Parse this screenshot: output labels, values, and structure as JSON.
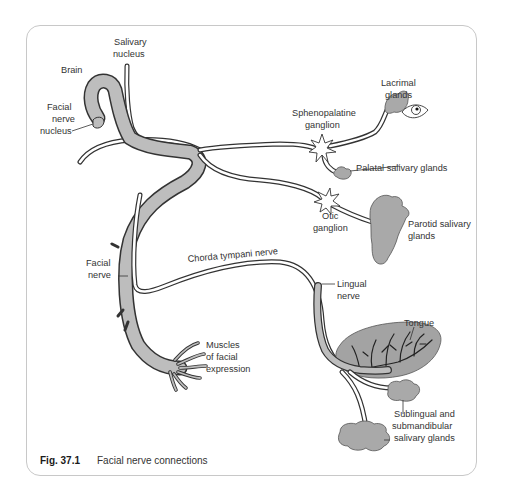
{
  "figure": {
    "caption_number": "Fig. 37.1",
    "caption_text": "Facial nerve connections"
  },
  "labels": {
    "salivary_nucleus_1": "Salivary",
    "salivary_nucleus_2": "nucleus",
    "brain": "Brain",
    "facial_nerve_nucleus_1": "Facial",
    "facial_nerve_nucleus_2": "nerve",
    "facial_nerve_nucleus_3": "nucleus",
    "lacrimal_1": "Lacrimal",
    "lacrimal_2": "glands",
    "sphenopalatine_1": "Sphenopalatine",
    "sphenopalatine_2": "ganglion",
    "palatal": "Palatal salivary glands",
    "otic_1": "Otic",
    "otic_2": "ganglion",
    "parotid_1": "Parotid salivary",
    "parotid_2": "glands",
    "chorda_tympani": "Chorda tympani nerve",
    "facial_nerve_1": "Facial",
    "facial_nerve_2": "nerve",
    "lingual_1": "Lingual",
    "lingual_2": "nerve",
    "tongue": "Tongue",
    "muscles_1": "Muscles",
    "muscles_2": "of facial",
    "muscles_3": "expression",
    "sublingual_1": "Sublingual and",
    "sublingual_2": "submandibular",
    "sublingual_3": "salivary glands"
  },
  "colors": {
    "nerve_fill": "#bdbdbd",
    "gland_fill": "#a9a9a9",
    "outline": "#333333",
    "frame_border": "#c8c8c8"
  }
}
